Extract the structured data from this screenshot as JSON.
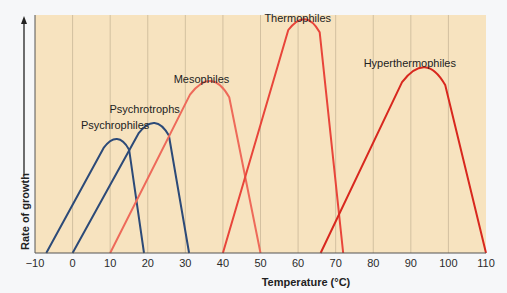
{
  "chart_data": {
    "type": "line",
    "title": "",
    "xlabel": "Temperature (°C)",
    "ylabel": "Rate of growth",
    "xlim": [
      -10,
      110
    ],
    "x_ticks": [
      -10,
      0,
      10,
      20,
      30,
      40,
      50,
      60,
      70,
      80,
      90,
      100,
      110
    ],
    "x_tick_labels": [
      "−10",
      "0",
      "10",
      "20",
      "30",
      "40",
      "50",
      "60",
      "70",
      "80",
      "90",
      "100",
      "110"
    ],
    "grid": "vertical",
    "background_color": "#f7e3bf",
    "series": [
      {
        "name": "Psychrophiles",
        "color": "#2c4a78",
        "min": -7,
        "optimum": 12,
        "max": 19,
        "relative_peak": 0.49
      },
      {
        "name": "Psychrotrophs",
        "color": "#2c4a78",
        "min": 0,
        "optimum": 22,
        "max": 31,
        "relative_peak": 0.56
      },
      {
        "name": "Mesophiles",
        "color": "#ee6a5a",
        "min": 10,
        "optimum": 37,
        "max": 50,
        "relative_peak": 0.74
      },
      {
        "name": "Thermophiles",
        "color": "#e8453a",
        "min": 40,
        "optimum": 62,
        "max": 72,
        "relative_peak": 1.0
      },
      {
        "name": "Hyperthermophiles",
        "color": "#d8281e",
        "min": 66,
        "optimum": 94,
        "max": 110,
        "relative_peak": 0.8
      }
    ]
  }
}
